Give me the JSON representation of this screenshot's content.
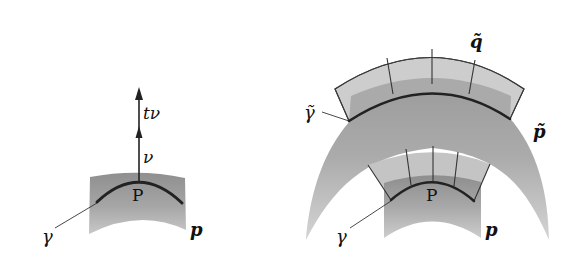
{
  "figure": {
    "left_panel": {
      "point_label": "P",
      "curve_label": "γ",
      "surface_label": "p",
      "normal_label": "ν",
      "scaled_normal_label": "tν"
    },
    "right_panel": {
      "point_label": "P",
      "curve_label": "γ",
      "surface_label": "p",
      "offset_curve_label": "γ̃",
      "offset_surface_label": "p̃",
      "band_label": "q̃"
    },
    "colors": {
      "background": "#ffffff",
      "surface_light": "#c9c9c9",
      "surface_mid": "#a9a9a9",
      "surface_dark": "#8e8e8e",
      "band_fill": "#cfcfcf",
      "curve": "#2a2a2a",
      "label": "#111111"
    }
  }
}
